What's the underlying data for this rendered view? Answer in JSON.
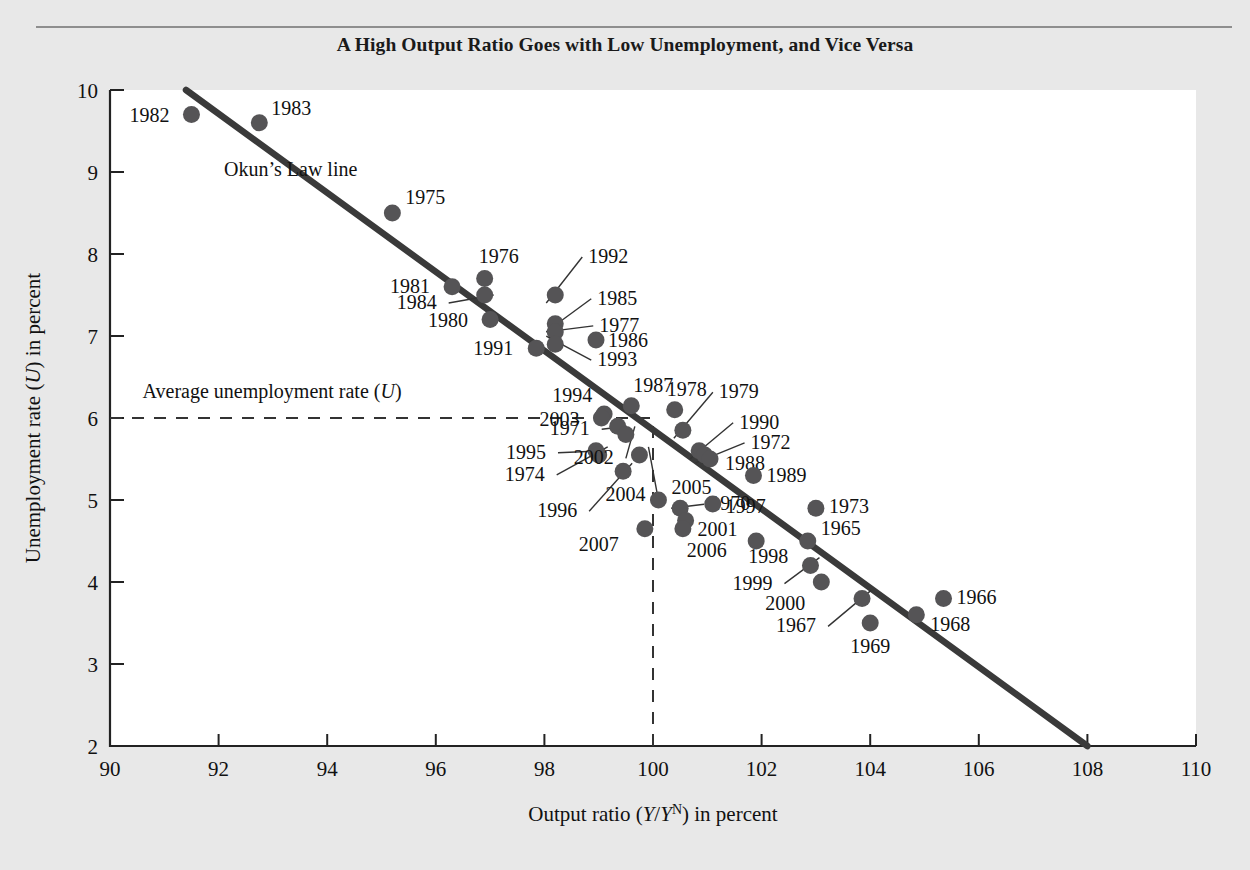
{
  "chart_data": {
    "type": "scatter",
    "title": "A High Output Ratio Goes with Low Unemployment, and Vice Versa",
    "xlabel": "Output ratio (Y/Yᴺ) in percent",
    "xlabel_parts": {
      "prefix": "Output ratio (",
      "y1": "Y",
      "slash": "/",
      "y2": "Y",
      "sup": "N",
      "suffix": ") in percent"
    },
    "ylabel": "Unemployment rate (U) in percent",
    "ylabel_parts": {
      "prefix": "Unemployment rate (",
      "symbol": "U",
      "suffix": ") in percent"
    },
    "xlim": [
      90,
      110
    ],
    "ylim": [
      2,
      10
    ],
    "xticks": [
      90,
      92,
      94,
      96,
      98,
      100,
      102,
      104,
      106,
      108,
      110
    ],
    "yticks": [
      2,
      3,
      4,
      5,
      6,
      7,
      8,
      9,
      10
    ],
    "grid": false,
    "legend": "none",
    "xunit": "percent",
    "yunit": "percent",
    "dot_color": "#555456",
    "line_color": "#3a3a3a",
    "background": "#ffffff",
    "page_background": "#e8e8e8",
    "annotations": [
      {
        "name": "okun-law-line-label",
        "text": "Okun’s Law line",
        "x": 92.1,
        "y": 8.95
      },
      {
        "name": "average-unemployment-label",
        "text": "Average unemployment rate (U)",
        "x": 90.6,
        "y": 6.25,
        "parts": {
          "prefix": "Average unemployment rate (",
          "symbol": "U",
          "suffix": ")"
        }
      }
    ],
    "reference_lines": [
      {
        "name": "average-unemployment-rate-line",
        "orientation": "horizontal",
        "value": 6.0,
        "style": "dashed",
        "x_from": 90,
        "x_to": 100
      },
      {
        "name": "natural-output-line",
        "orientation": "vertical",
        "value": 100,
        "style": "dashed",
        "y_from": 2,
        "y_to": 5.95
      }
    ],
    "trend_line": {
      "name": "okuns-law-line",
      "label": "Okun's Law line",
      "x_from": 91.4,
      "y_from": 10.0,
      "x_to": 108.0,
      "y_to": 2.0,
      "slope": -0.482
    },
    "points": [
      {
        "year": "1982",
        "x": 91.5,
        "y": 9.7,
        "label_dx": -62,
        "label_dy": 7
      },
      {
        "year": "1983",
        "x": 92.75,
        "y": 9.6,
        "label_dx": 12,
        "label_dy": -8
      },
      {
        "year": "1975",
        "x": 95.2,
        "y": 8.5,
        "label_dx": 13,
        "label_dy": -9
      },
      {
        "year": "1981",
        "x": 96.3,
        "y": 7.6,
        "label_dx": -62,
        "label_dy": 6
      },
      {
        "year": "1976",
        "x": 96.9,
        "y": 7.7,
        "label_dx": -6,
        "label_dy": -16
      },
      {
        "year": "1984",
        "x": 96.9,
        "y": 7.5,
        "label_dx": -88,
        "label_dy": 14,
        "leader": true
      },
      {
        "year": "1980",
        "x": 97.0,
        "y": 7.2,
        "label_dx": -62,
        "label_dy": 7
      },
      {
        "year": "1991",
        "x": 97.85,
        "y": 6.85,
        "label_dx": -63,
        "label_dy": 7
      },
      {
        "year": "1992",
        "x": 98.2,
        "y": 7.5,
        "label_dx": 33,
        "label_dy": -32,
        "leader": true
      },
      {
        "year": "1985",
        "x": 98.2,
        "y": 7.15,
        "label_dx": 42,
        "label_dy": -19,
        "leader": true
      },
      {
        "year": "1977",
        "x": 98.2,
        "y": 7.05,
        "label_dx": 44,
        "label_dy": 0,
        "leader": true
      },
      {
        "year": "1986",
        "x": 98.95,
        "y": 6.95,
        "label_dx": 12,
        "label_dy": 7
      },
      {
        "year": "1993",
        "x": 98.2,
        "y": 6.9,
        "label_dx": 42,
        "label_dy": 22,
        "leader": true
      },
      {
        "year": "1994",
        "x": 99.1,
        "y": 6.05,
        "label_dx": -52,
        "label_dy": -12
      },
      {
        "year": "2003",
        "x": 99.05,
        "y": 6.0,
        "label_dx": -62,
        "label_dy": 8
      },
      {
        "year": "1987",
        "x": 99.6,
        "y": 6.15,
        "label_dx": 2,
        "label_dy": -14
      },
      {
        "year": "1978",
        "x": 100.4,
        "y": 6.1,
        "label_dx": -8,
        "label_dy": -14
      },
      {
        "year": "1971",
        "x": 99.35,
        "y": 5.9,
        "label_dx": -68,
        "label_dy": 9,
        "leader": true
      },
      {
        "year": "1995",
        "x": 98.95,
        "y": 5.6,
        "label_dx": -90,
        "label_dy": 8,
        "leader": true
      },
      {
        "year": "1974",
        "x": 99.0,
        "y": 5.55,
        "label_dx": -94,
        "label_dy": 26,
        "leader": true
      },
      {
        "year": "2002",
        "x": 99.5,
        "y": 5.8,
        "label_dx": -52,
        "label_dy": 30,
        "leader": true
      },
      {
        "year": "1979",
        "x": 100.55,
        "y": 5.85,
        "label_dx": 36,
        "label_dy": -32,
        "leader": true
      },
      {
        "year": "1990",
        "x": 100.85,
        "y": 5.6,
        "label_dx": 40,
        "label_dy": -22,
        "leader": true
      },
      {
        "year": "1972",
        "x": 100.95,
        "y": 5.55,
        "label_dx": 46,
        "label_dy": -6,
        "leader": true
      },
      {
        "year": "1988",
        "x": 101.05,
        "y": 5.5,
        "label_dx": 15,
        "label_dy": 11
      },
      {
        "year": "1996",
        "x": 99.45,
        "y": 5.35,
        "label_dx": -86,
        "label_dy": 46,
        "leader": true
      },
      {
        "year": "2004",
        "x": 99.75,
        "y": 5.55,
        "label_dx": -34,
        "label_dy": 46,
        "leader": true
      },
      {
        "year": "1989",
        "x": 101.85,
        "y": 5.3,
        "label_dx": 13,
        "label_dy": 7
      },
      {
        "year": "2005",
        "x": 100.1,
        "y": 5.0,
        "label_dx": 13,
        "label_dy": -6
      },
      {
        "year": "1970",
        "x": 100.5,
        "y": 4.9,
        "label_dx": 30,
        "label_dy": 2,
        "leader": true
      },
      {
        "year": "1997",
        "x": 101.1,
        "y": 4.95,
        "label_dx": 13,
        "label_dy": 9
      },
      {
        "year": "1973",
        "x": 103.0,
        "y": 4.9,
        "label_dx": 13,
        "label_dy": 5
      },
      {
        "year": "2001",
        "x": 100.6,
        "y": 4.75,
        "label_dx": 12,
        "label_dy": 15
      },
      {
        "year": "2006",
        "x": 100.55,
        "y": 4.65,
        "label_dx": 4,
        "label_dy": 28
      },
      {
        "year": "2007",
        "x": 99.85,
        "y": 4.65,
        "label_dx": -66,
        "label_dy": 22
      },
      {
        "year": "1965",
        "x": 102.85,
        "y": 4.5,
        "label_dx": 13,
        "label_dy": -6
      },
      {
        "year": "1998",
        "x": 101.9,
        "y": 4.5,
        "label_dx": -8,
        "label_dy": 22
      },
      {
        "year": "1999",
        "x": 102.9,
        "y": 4.2,
        "label_dx": -78,
        "label_dy": 24,
        "leader": true
      },
      {
        "year": "2000",
        "x": 103.1,
        "y": 4.0,
        "label_dx": -56,
        "label_dy": 28
      },
      {
        "year": "1967",
        "x": 103.85,
        "y": 3.8,
        "label_dx": -86,
        "label_dy": 34,
        "leader": true
      },
      {
        "year": "1969",
        "x": 104.0,
        "y": 3.5,
        "label_dx": -20,
        "label_dy": 30
      },
      {
        "year": "1966",
        "x": 105.35,
        "y": 3.8,
        "label_dx": 13,
        "label_dy": 6
      },
      {
        "year": "1968",
        "x": 104.85,
        "y": 3.6,
        "label_dx": 14,
        "label_dy": 16
      }
    ]
  }
}
